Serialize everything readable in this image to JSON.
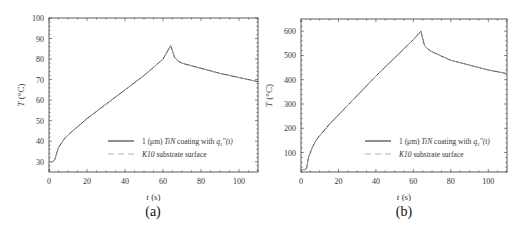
{
  "chart_data": [
    {
      "panel": "(a)",
      "type": "line",
      "title": "",
      "xlabel": "t (s)",
      "ylabel": "T (°C)",
      "xlim": [
        0,
        110
      ],
      "ylim": [
        25,
        100
      ],
      "xticks": [
        0,
        20,
        40,
        60,
        80,
        100
      ],
      "yticks": [
        30,
        40,
        50,
        60,
        70,
        80,
        90,
        100
      ],
      "grid": false,
      "legend_position": "lower right",
      "series": [
        {
          "name": "1 (μm) TiN coating with q1''(t)",
          "style": "solid",
          "x": [
            0,
            2,
            3,
            5,
            8,
            10,
            15,
            20,
            30,
            40,
            50,
            60,
            64,
            65,
            66,
            68,
            70,
            80,
            90,
            100,
            110
          ],
          "y": [
            30,
            30,
            31,
            37,
            41,
            43,
            47,
            51,
            58,
            65,
            72,
            80,
            86.5,
            84,
            81,
            79,
            78,
            75.5,
            73,
            71,
            69
          ]
        },
        {
          "name": "K10 substrate surface",
          "style": "dashed",
          "x": [
            0,
            2,
            3,
            5,
            8,
            10,
            15,
            20,
            30,
            40,
            50,
            60,
            64,
            65,
            66,
            68,
            70,
            80,
            90,
            100,
            110
          ],
          "y": [
            30,
            30,
            31,
            37,
            41,
            43,
            47,
            51,
            58,
            65,
            72,
            80,
            86.3,
            84,
            81,
            79,
            78,
            75.5,
            73,
            71,
            69
          ]
        }
      ]
    },
    {
      "panel": "(b)",
      "type": "line",
      "title": "",
      "xlabel": "t (s)",
      "ylabel": "T (°C)",
      "xlim": [
        0,
        110
      ],
      "ylim": [
        20,
        650
      ],
      "xticks": [
        0,
        20,
        40,
        60,
        80,
        100
      ],
      "yticks": [
        100,
        200,
        300,
        400,
        500,
        600
      ],
      "grid": false,
      "legend_position": "lower right",
      "series": [
        {
          "name": "1 (μm) TiN coating with q2''(t)",
          "style": "solid",
          "x": [
            0,
            2,
            3,
            4,
            6,
            8,
            10,
            15,
            20,
            30,
            40,
            50,
            60,
            64,
            65,
            66,
            68,
            70,
            80,
            90,
            100,
            110
          ],
          "y": [
            30,
            30,
            35,
            80,
            120,
            150,
            170,
            215,
            255,
            335,
            415,
            490,
            565,
            600,
            570,
            540,
            525,
            515,
            480,
            460,
            440,
            425
          ]
        },
        {
          "name": "K10 substrate surface",
          "style": "dashed",
          "x": [
            0,
            2,
            3,
            4,
            6,
            8,
            10,
            15,
            20,
            30,
            40,
            50,
            60,
            64,
            65,
            66,
            68,
            70,
            80,
            90,
            100,
            110
          ],
          "y": [
            30,
            30,
            35,
            80,
            120,
            150,
            170,
            215,
            255,
            335,
            415,
            490,
            565,
            598,
            570,
            540,
            525,
            515,
            480,
            460,
            440,
            425
          ]
        }
      ]
    }
  ],
  "panels": [
    {
      "caption": "(a)",
      "xlabel_var": "t",
      "xlabel_unit": " (s)",
      "ylabel_var": "T",
      "ylabel_unit": " (°C)",
      "legend": [
        {
          "prefix": "1 (μm) ",
          "mat": "TiN",
          "mid": " coating with ",
          "q": "q",
          "sub": "1",
          "suffix": "''(t)"
        },
        {
          "prefix": "",
          "mat": "K10",
          "mid": " substrate surface",
          "q": "",
          "sub": "",
          "suffix": ""
        }
      ]
    },
    {
      "caption": "(b)",
      "xlabel_var": "t",
      "xlabel_unit": " (s)",
      "ylabel_var": "T",
      "ylabel_unit": " (°C)",
      "legend": [
        {
          "prefix": "1 (μm) ",
          "mat": "TiN",
          "mid": " coating with ",
          "q": "q",
          "sub": "2",
          "suffix": "''(t)"
        },
        {
          "prefix": "",
          "mat": "K10",
          "mid": " substrate surface",
          "q": "",
          "sub": "",
          "suffix": ""
        }
      ]
    }
  ],
  "colors": {
    "solid_line": "#444444",
    "dashed_line": "#aaaaaa",
    "axis": "#333333"
  }
}
